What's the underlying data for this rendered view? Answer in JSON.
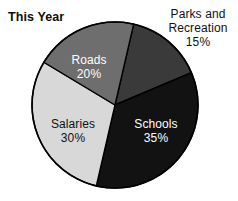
{
  "chart_data": {
    "type": "pie",
    "title": "This Year",
    "xlabel": "",
    "ylabel": "",
    "legend_position": "none",
    "grid": false,
    "unit": "%",
    "categories": [
      "Parks and Recreation",
      "Schools",
      "Salaries",
      "Roads"
    ],
    "values": [
      15,
      35,
      30,
      20
    ],
    "slices": [
      {
        "name": "Parks and Recreation",
        "label_line1": "Parks and",
        "label_line2": "Recreation",
        "value": 15,
        "value_text": "15%",
        "color": "#3a3a3a",
        "text_color": "#111111",
        "label_placement": "outside-right"
      },
      {
        "name": "Schools",
        "label_line1": "Schools",
        "label_line2": "",
        "value": 35,
        "value_text": "35%",
        "color": "#121212",
        "text_color": "#ffffff",
        "label_placement": "inside"
      },
      {
        "name": "Salaries",
        "label_line1": "Salaries",
        "label_line2": "",
        "value": 30,
        "value_text": "30%",
        "color": "#d8d8d8",
        "text_color": "#101010",
        "label_placement": "inside"
      },
      {
        "name": "Roads",
        "label_line1": "Roads",
        "label_line2": "",
        "value": 20,
        "value_text": "20%",
        "color": "#6e6e6e",
        "text_color": "#ffffff",
        "label_placement": "inside"
      }
    ],
    "geometry": {
      "center_x": 115,
      "center_y": 105,
      "radius": 83,
      "start_angle_deg": 13,
      "direction": "clockwise"
    },
    "outline_color": "#000000",
    "background": "#ffffff"
  }
}
